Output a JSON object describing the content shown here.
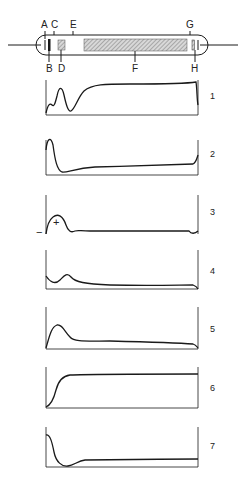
{
  "tube": {
    "labels_top": [
      {
        "id": "A",
        "x": 42
      },
      {
        "id": "C",
        "x": 52
      },
      {
        "id": "E",
        "x": 72
      },
      {
        "id": "G",
        "x": 189
      }
    ],
    "labels_bottom": [
      {
        "id": "B",
        "x": 48
      },
      {
        "id": "D",
        "x": 61
      },
      {
        "id": "F",
        "x": 135
      },
      {
        "id": "H",
        "x": 195
      }
    ]
  },
  "plots": [
    {
      "number": "1"
    },
    {
      "number": "2"
    },
    {
      "number": "3",
      "plus_sign": "+",
      "minus_sign": "−"
    },
    {
      "number": "4"
    },
    {
      "number": "5"
    },
    {
      "number": "6"
    },
    {
      "number": "7"
    }
  ],
  "colors": {
    "ink": "#1a1a1a",
    "hatch": "#9a9a9a",
    "background": "#ffffff"
  }
}
